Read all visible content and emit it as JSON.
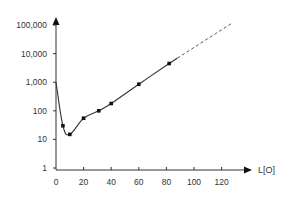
{
  "chart_data": {
    "type": "line",
    "title": "",
    "xlabel": "L[O]",
    "ylabel": "",
    "yscale": "log",
    "xlim": [
      0,
      130
    ],
    "ylim": [
      1,
      100000
    ],
    "grid": false,
    "legend": null,
    "x_ticks": [
      0,
      20,
      40,
      60,
      80,
      100,
      120
    ],
    "x_tick_labels": [
      "0",
      "20",
      "40",
      "60",
      "80",
      "100",
      "120"
    ],
    "y_ticks": [
      1,
      10,
      100,
      1000,
      10000,
      100000
    ],
    "y_tick_labels": [
      "1",
      "10",
      "100",
      "1,000",
      "10,000",
      "100,000"
    ],
    "series": [
      {
        "name": "measured",
        "style": "solid",
        "curve_start": {
          "x": 0,
          "y": 1000
        },
        "points": [
          {
            "x": 5,
            "y": 30
          },
          {
            "x": 10,
            "y": 15
          },
          {
            "x": 20,
            "y": 55
          },
          {
            "x": 31,
            "y": 100
          },
          {
            "x": 40,
            "y": 180
          },
          {
            "x": 60,
            "y": 850
          },
          {
            "x": 82,
            "y": 4500
          }
        ]
      },
      {
        "name": "extrapolation",
        "style": "dashed",
        "points": [
          {
            "x": 88,
            "y": 7000
          },
          {
            "x": 128,
            "y": 120000
          }
        ]
      }
    ],
    "colors": {
      "line": "#333333",
      "marker": "#111111",
      "axis": "#333333"
    }
  }
}
